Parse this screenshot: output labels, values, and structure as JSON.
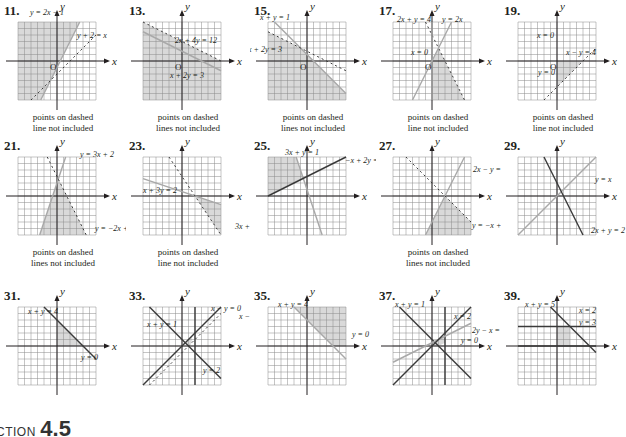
{
  "page": {
    "section_heading_prefix": "CTION",
    "section_heading_number": "4.5"
  },
  "style": {
    "grid_color": "#8a8a8a",
    "shade_color": "#d9d9d9",
    "axis_color": "#231f20",
    "solid_line_color": "#3a3a3a",
    "gray_line_color": "#a8a8a8"
  },
  "problems": [
    {
      "id": "11",
      "label": "11.",
      "note": "points on dashed\nline not included",
      "x": 0,
      "y": 0,
      "lines": [
        {
          "eq": "y = 2x − 1",
          "p1": [
            -2.5,
            -6
          ],
          "p2": [
            3.5,
            6
          ],
          "style": "gray"
        },
        {
          "eq": "y + 2 = x",
          "p1": [
            -4,
            -6
          ],
          "p2": [
            6,
            4
          ],
          "style": "dashed"
        }
      ],
      "shade": [
        [
          -6,
          6
        ],
        [
          3.5,
          6
        ],
        [
          -2.5,
          -6
        ],
        [
          -6,
          -6
        ]
      ],
      "labels": [
        {
          "text": "y = 2x − 1",
          "x": 30,
          "y": 15
        },
        {
          "text": "y + 2 = x",
          "x": 77,
          "y": 38
        }
      ],
      "origin_label": "O"
    },
    {
      "id": "13",
      "label": "13.",
      "note": "points on dashed\nlines not included",
      "x": 125,
      "y": 0,
      "lines": [
        {
          "eq": "2x + 4y = 12",
          "p1": [
            -6,
            6
          ],
          "p2": [
            6,
            0
          ],
          "style": "dashed"
        },
        {
          "eq": "x + 2y = 3",
          "p1": [
            -6,
            4.5
          ],
          "p2": [
            6,
            -1.5
          ],
          "style": "gray"
        }
      ],
      "shade": [
        [
          -6,
          6
        ],
        [
          6,
          0
        ],
        [
          6,
          -6
        ],
        [
          -6,
          -6
        ]
      ],
      "labels": [
        {
          "text": "2x + 4y = 12",
          "x": 50,
          "y": 43
        },
        {
          "text": "x + 2y = 3",
          "x": 45,
          "y": 78
        }
      ],
      "origin_label": "O"
    },
    {
      "id": "15",
      "label": "15.",
      "note": "points on dashed\nlines not included",
      "x": 250,
      "y": 0,
      "lines": [
        {
          "eq": "x + y = 1",
          "p1": [
            -5,
            6
          ],
          "p2": [
            6,
            -5
          ],
          "style": "gray"
        },
        {
          "eq": "x + 2y = 3",
          "p1": [
            -6,
            4.5
          ],
          "p2": [
            6,
            -1.5
          ],
          "style": "dashed"
        }
      ],
      "shade": [
        [
          -6,
          4.5
        ],
        [
          -1,
          2
        ],
        [
          6,
          -5
        ],
        [
          6,
          -6
        ],
        [
          -6,
          -6
        ]
      ],
      "labels": [
        {
          "text": "x + y = 1",
          "x": 10,
          "y": 20
        },
        {
          "text": "x + 2y = 3",
          "x": -2,
          "y": 52
        }
      ],
      "origin_label": "O"
    },
    {
      "id": "17",
      "label": "17.",
      "note": "points on dashed\nline not included",
      "x": 375,
      "y": 0,
      "lines": [
        {
          "eq": "2x + y = 4",
          "p1": [
            -1,
            6
          ],
          "p2": [
            5,
            -6
          ],
          "style": "dashed"
        },
        {
          "eq": "y = 2x",
          "p1": [
            -3,
            -6
          ],
          "p2": [
            3,
            6
          ],
          "style": "gray"
        },
        {
          "eq": "x = 0",
          "p1": [
            0,
            -6
          ],
          "p2": [
            0,
            6
          ],
          "style": "gray"
        }
      ],
      "shade": [
        [
          0,
          0
        ],
        [
          1,
          2
        ],
        [
          5,
          -6
        ],
        [
          0,
          -6
        ]
      ],
      "labels": [
        {
          "text": "2x + y = 4",
          "x": 22,
          "y": 22
        },
        {
          "text": "y = 2x",
          "x": 67,
          "y": 22
        },
        {
          "text": "x = 0",
          "x": 36,
          "y": 55
        }
      ],
      "origin_label": "O"
    },
    {
      "id": "19",
      "label": "19.",
      "note": "points on dashed\nline not included",
      "x": 500,
      "y": 0,
      "lines": [
        {
          "eq": "x − y = 4",
          "p1": [
            -2,
            -6
          ],
          "p2": [
            6,
            2
          ],
          "style": "dashed"
        }
      ],
      "shade": [
        [
          0,
          0
        ],
        [
          4,
          0
        ],
        [
          0,
          -4
        ]
      ],
      "labels": [
        {
          "text": "x = 0",
          "x": 37,
          "y": 38
        },
        {
          "text": "x − y = 4",
          "x": 66,
          "y": 55
        },
        {
          "text": "y = 0",
          "x": 38,
          "y": 75
        }
      ],
      "origin_label": "O"
    },
    {
      "id": "21",
      "label": "21.",
      "note": "points on dashed\nlines not included",
      "x": 0,
      "y": 135,
      "lines": [
        {
          "eq": "y = 3x + 2",
          "p1": [
            -2.67,
            -6
          ],
          "p2": [
            1.33,
            6
          ],
          "style": "gray"
        },
        {
          "eq": "y = −2x + 3",
          "p1": [
            -1.5,
            6
          ],
          "p2": [
            4.5,
            -6
          ],
          "style": "dashed"
        }
      ],
      "shade": [
        [
          -2.67,
          -6
        ],
        [
          0.2,
          2.6
        ],
        [
          4.5,
          -6
        ]
      ],
      "labels": [
        {
          "text": "y = 3x + 2",
          "x": 80,
          "y": 22
        },
        {
          "text": "y = −2x + 3",
          "x": 95,
          "y": 96
        }
      ],
      "origin_label": ""
    },
    {
      "id": "23",
      "label": "23.",
      "note": "points on dashed\nline not included",
      "x": 125,
      "y": 135,
      "lines": [
        {
          "eq": "x + 3y = 2",
          "p1": [
            -6,
            2.67
          ],
          "p2": [
            6,
            -1.33
          ],
          "style": "gray"
        },
        {
          "eq": "3x + 2y = 6",
          "p1": [
            -2,
            6
          ],
          "p2": [
            6,
            -6
          ],
          "style": "dashed"
        }
      ],
      "shade": [
        [
          2,
          0
        ],
        [
          6,
          -1.33
        ],
        [
          6,
          -6
        ]
      ],
      "labels": [
        {
          "text": "x + 3y = 2",
          "x": 18,
          "y": 58
        },
        {
          "text": "3x + 2y = 6",
          "x": 110,
          "y": 94
        }
      ],
      "origin_label": ""
    },
    {
      "id": "25",
      "label": "25.",
      "note": "",
      "x": 250,
      "y": 135,
      "lines": [
        {
          "eq": "3x + y = 1",
          "p1": [
            -1.67,
            6
          ],
          "p2": [
            2.33,
            -6
          ],
          "style": "gray"
        },
        {
          "eq": "−x + 2y = 6",
          "p1": [
            -6,
            0
          ],
          "p2": [
            6,
            6
          ],
          "style": "solid"
        }
      ],
      "shade": [
        [
          -6,
          6
        ],
        [
          -1.67,
          6
        ],
        [
          -0.57,
          2.71
        ],
        [
          -6,
          0
        ]
      ],
      "labels": [
        {
          "text": "3x + y = 1",
          "x": 35,
          "y": 20
        },
        {
          "text": "−x + 2y = 6",
          "x": 95,
          "y": 28
        }
      ],
      "origin_label": ""
    },
    {
      "id": "27",
      "label": "27.",
      "note": "points on dashed\nlines not included",
      "x": 375,
      "y": 135,
      "lines": [
        {
          "eq": "2x − y = 4",
          "p1": [
            -1,
            -6
          ],
          "p2": [
            5,
            6
          ],
          "style": "gray"
        },
        {
          "eq": "y = −x + 2",
          "p1": [
            -4,
            6
          ],
          "p2": [
            6,
            -4
          ],
          "style": "dashed"
        }
      ],
      "shade": [
        [
          2,
          0
        ],
        [
          6,
          -4
        ],
        [
          6,
          -6
        ],
        [
          -1,
          -6
        ]
      ],
      "labels": [
        {
          "text": "2x − y = 4",
          "x": 98,
          "y": 37
        },
        {
          "text": "y = −x + 2",
          "x": 97,
          "y": 93
        }
      ],
      "origin_label": ""
    },
    {
      "id": "29",
      "label": "29.",
      "note": "",
      "x": 500,
      "y": 135,
      "lines": [
        {
          "eq": "y = x",
          "p1": [
            -6,
            -6
          ],
          "p2": [
            6,
            6
          ],
          "style": "gray"
        },
        {
          "eq": "2x + y = 2",
          "p1": [
            -2,
            6
          ],
          "p2": [
            4,
            -6
          ],
          "style": "solid"
        }
      ],
      "shade": [],
      "labels": [
        {
          "text": "y = x",
          "x": 95,
          "y": 47
        },
        {
          "text": "2x + y = 2",
          "x": 91,
          "y": 98
        }
      ],
      "origin_label": ""
    },
    {
      "id": "31",
      "label": "31.",
      "note": "",
      "x": 0,
      "y": 285,
      "lines": [
        {
          "eq": "x + y = 4",
          "p1": [
            -2,
            6
          ],
          "p2": [
            6,
            -2
          ],
          "style": "solid"
        }
      ],
      "shade": [
        [
          0,
          0
        ],
        [
          0,
          4
        ],
        [
          4,
          0
        ]
      ],
      "labels": [
        {
          "text": "x + y = 4",
          "x": 28,
          "y": 29
        },
        {
          "text": "y = 0",
          "x": 81,
          "y": 75
        }
      ],
      "origin_label": ""
    },
    {
      "id": "33",
      "label": "33.",
      "note": "",
      "x": 125,
      "y": 285,
      "lines": [
        {
          "eq": "x − y = 0",
          "p1": [
            -6,
            -6
          ],
          "p2": [
            6,
            6
          ],
          "style": "solid"
        },
        {
          "eq": "x + y = 1",
          "p1": [
            -5,
            6
          ],
          "p2": [
            6,
            -5
          ],
          "style": "solid"
        },
        {
          "eq": "x − y = 1",
          "p1": [
            -5,
            -6
          ],
          "p2": [
            6,
            5
          ],
          "style": "dashed"
        },
        {
          "eq": "y = 2",
          "p1": [
            2,
            -6
          ],
          "p2": [
            2,
            6
          ],
          "style": "solid"
        }
      ],
      "shade": [
        [
          0.5,
          0.5
        ],
        [
          1,
          0
        ],
        [
          1.5,
          0.5
        ],
        [
          1.5,
          1.5
        ],
        [
          1,
          1
        ]
      ],
      "labels": [
        {
          "text": "x − y = 0",
          "x": 86,
          "y": 26
        },
        {
          "text": "x − y",
          "x": 114,
          "y": 34
        },
        {
          "text": "x + y = 1",
          "x": 22,
          "y": 42
        },
        {
          "text": "y = 2",
          "x": 78,
          "y": 88
        }
      ],
      "origin_label": ""
    },
    {
      "id": "35",
      "label": "35.",
      "note": "",
      "x": 250,
      "y": 285,
      "lines": [
        {
          "eq": "x + y = 4",
          "p1": [
            -2,
            6
          ],
          "p2": [
            6,
            -2
          ],
          "style": "gray"
        }
      ],
      "shade": [
        [
          -2,
          6
        ],
        [
          6,
          6
        ],
        [
          6,
          0
        ],
        [
          4,
          0
        ]
      ],
      "labels": [
        {
          "text": "x + y = 4",
          "x": 28,
          "y": 22
        },
        {
          "text": "y = 0",
          "x": 102,
          "y": 52
        }
      ],
      "origin_label": ""
    },
    {
      "id": "37",
      "label": "37.",
      "note": "",
      "x": 375,
      "y": 285,
      "lines": [
        {
          "eq": "x + y = 1",
          "p1": [
            -5,
            6
          ],
          "p2": [
            6,
            -5
          ],
          "style": "solid"
        },
        {
          "eq": "x = 2",
          "p1": [
            2,
            -6
          ],
          "p2": [
            2,
            6
          ],
          "style": "solid"
        },
        {
          "eq": "2y − x = 1",
          "p1": [
            -6,
            -2.5
          ],
          "p2": [
            6,
            3.5
          ],
          "style": "gray"
        },
        {
          "eq": "y = 0",
          "p1": [
            -6,
            -6
          ],
          "p2": [
            6,
            6
          ],
          "style": "solid"
        }
      ],
      "shade": [
        [
          0,
          0
        ],
        [
          1,
          0
        ],
        [
          2,
          0.5
        ],
        [
          2,
          1.5
        ],
        [
          0.33,
          0.67
        ]
      ],
      "labels": [
        {
          "text": "x + y = 1",
          "x": 20,
          "y": 22
        },
        {
          "text": "x = 2",
          "x": 79,
          "y": 34
        },
        {
          "text": "2y − x = 1",
          "x": 97,
          "y": 48
        },
        {
          "text": "y = 0",
          "x": 86,
          "y": 58
        }
      ],
      "origin_label": ""
    },
    {
      "id": "39",
      "label": "39.",
      "note": "",
      "x": 500,
      "y": 285,
      "lines": [
        {
          "eq": "x + y = 5",
          "p1": [
            -1,
            6
          ],
          "p2": [
            6,
            -1
          ],
          "style": "solid"
        },
        {
          "eq": "x = 2",
          "p1": [
            -6,
            3
          ],
          "p2": [
            6,
            3
          ],
          "style": "solid"
        },
        {
          "eq": "y = 3",
          "p1": [
            -6,
            0
          ],
          "p2": [
            6,
            0
          ],
          "style": "solid"
        }
      ],
      "shade": [
        [
          0,
          0
        ],
        [
          2,
          0
        ],
        [
          2,
          3
        ],
        [
          0,
          3
        ]
      ],
      "labels": [
        {
          "text": "x + y = 5",
          "x": 25,
          "y": 22
        },
        {
          "text": "x = 2",
          "x": 79,
          "y": 28
        },
        {
          "text": "y = 3",
          "x": 79,
          "y": 40
        }
      ],
      "origin_label": ""
    }
  ]
}
